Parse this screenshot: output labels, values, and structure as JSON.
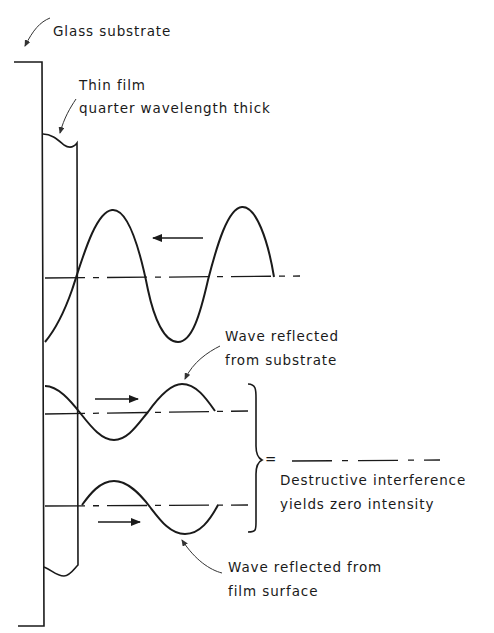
{
  "diagram": {
    "labels": {
      "glass_substrate": "Glass substrate",
      "thin_film_line1": "Thin film",
      "thin_film_line2": "quarter wavelength thick",
      "reflected_substrate_line1": "Wave reflected",
      "reflected_substrate_line2": "from substrate",
      "equals": "=",
      "destructive_line1": "Destructive interference",
      "destructive_line2": "yields zero intensity",
      "reflected_film_line1": "Wave reflected from",
      "reflected_film_line2": "film surface"
    },
    "arrows": {
      "incident_direction": "left",
      "reflected_substrate_direction": "right",
      "reflected_film_direction": "right"
    },
    "colors": {
      "ink": "#1a1a1a",
      "background": "#ffffff"
    }
  }
}
